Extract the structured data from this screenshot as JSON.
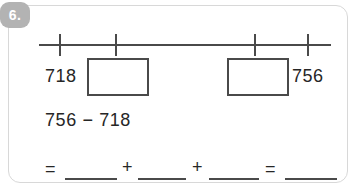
{
  "card": {
    "question_number": "6."
  },
  "number_line": {
    "tick_count": 4,
    "ticks": [
      {
        "name": "tick-1",
        "x": 20
      },
      {
        "name": "tick-2",
        "x": 76
      },
      {
        "name": "tick-3",
        "x": 215
      },
      {
        "name": "tick-4",
        "x": 268
      }
    ]
  },
  "values_row": {
    "left_label": "718",
    "right_label": "756",
    "boxes": [
      {
        "name": "answer-box-left",
        "value": "",
        "x": 78
      },
      {
        "name": "answer-box-right",
        "value": "",
        "x": 218
      }
    ],
    "left_label_x": 36,
    "right_label_x": 283
  },
  "equation": {
    "expression": "756 − 718"
  },
  "answer_line": {
    "tokens": [
      {
        "type": "operator",
        "name": "equals-sign-1",
        "text": "=",
        "x": 2
      },
      {
        "type": "blank",
        "name": "answer-blank-1",
        "text": "",
        "x": 22,
        "width": 52
      },
      {
        "type": "operator",
        "name": "plus-sign-1",
        "text": "+",
        "x": 79,
        "y": -2
      },
      {
        "type": "blank",
        "name": "answer-blank-2",
        "text": "",
        "x": 95,
        "width": 48
      },
      {
        "type": "operator",
        "name": "plus-sign-2",
        "text": "+",
        "x": 149,
        "y": -2
      },
      {
        "type": "blank",
        "name": "answer-blank-3",
        "text": "",
        "x": 166,
        "width": 50
      },
      {
        "type": "operator",
        "name": "equals-sign-2",
        "text": "=",
        "x": 222
      },
      {
        "type": "blank",
        "name": "answer-blank-4",
        "text": "",
        "x": 242,
        "width": 52
      }
    ]
  },
  "colors": {
    "ink": "#262626",
    "line": "#4a4a4a",
    "badge": "#b3b3b3",
    "card_border": "#d8d8d8",
    "page_background": "#ffffff"
  }
}
